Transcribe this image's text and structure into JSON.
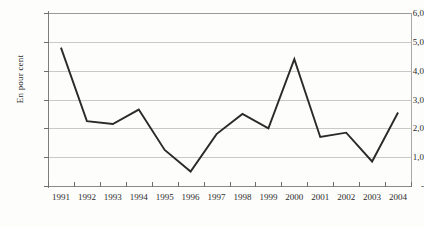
{
  "chart_data": {
    "type": "line",
    "title": "",
    "subtitle": "",
    "xlabel": "",
    "ylabel": "En pour cent",
    "categories": [
      "1991",
      "1992",
      "1993",
      "1994",
      "1995",
      "1996",
      "1997",
      "1998",
      "1999",
      "2000",
      "2001",
      "2002",
      "2003",
      "2004"
    ],
    "values": [
      4.8,
      2.25,
      2.15,
      2.65,
      1.25,
      0.5,
      1.8,
      2.5,
      2.0,
      4.4,
      1.7,
      1.85,
      0.85,
      2.55
    ],
    "series": [
      {
        "name": "En pour cent",
        "values": [
          4.8,
          2.25,
          2.15,
          2.65,
          1.25,
          0.5,
          1.8,
          2.5,
          2.0,
          4.4,
          1.7,
          1.85,
          0.85,
          2.55
        ]
      }
    ],
    "ylim": [
      0,
      6
    ],
    "xlim": [
      "1991",
      "2004"
    ],
    "y_tick_values": [
      0,
      1,
      2,
      3,
      4,
      5,
      6
    ],
    "y_tick_labels": [
      "-",
      "1,0",
      "2,0",
      "3,0",
      "4,0",
      "5,0",
      "6,0"
    ],
    "grid": true,
    "grid_axis": "y",
    "legend": false,
    "legend_position": "none",
    "markers": false,
    "line_color": "#2a2a2a",
    "grid_color": "#c9c9c9",
    "background_color": "#fdfdfc",
    "decimal_separator": ","
  },
  "axes": {
    "y": {
      "title": "En pour cent",
      "ticks": [
        {
          "label": "6,0",
          "value": 6
        },
        {
          "label": "5,0",
          "value": 5
        },
        {
          "label": "4,0",
          "value": 4
        },
        {
          "label": "3,0",
          "value": 3
        },
        {
          "label": "2,0",
          "value": 2
        },
        {
          "label": "1,0",
          "value": 1
        },
        {
          "label": "-",
          "value": 0
        }
      ]
    },
    "x": {
      "title": "",
      "ticks": [
        {
          "label": "1991"
        },
        {
          "label": "1992"
        },
        {
          "label": "1993"
        },
        {
          "label": "1994"
        },
        {
          "label": "1995"
        },
        {
          "label": "1996"
        },
        {
          "label": "1997"
        },
        {
          "label": "1998"
        },
        {
          "label": "1999"
        },
        {
          "label": "2000"
        },
        {
          "label": "2001"
        },
        {
          "label": "2002"
        },
        {
          "label": "2003"
        },
        {
          "label": "2004"
        }
      ]
    }
  }
}
